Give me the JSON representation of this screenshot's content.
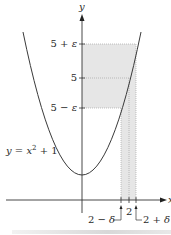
{
  "diagram": {
    "axes": {
      "x_label": "x",
      "y_label": "y"
    },
    "curve": {
      "label": "y = x² + 1",
      "label_parts": {
        "y": "y",
        "eq": " = ",
        "x": "x",
        "exp": "2",
        "rest": " + 1"
      }
    },
    "y_ticks": [
      {
        "label": "5 + ε",
        "parts": [
          "5 + ",
          "ε"
        ]
      },
      {
        "label": "5",
        "parts": [
          "5",
          ""
        ]
      },
      {
        "label": "5 − ε",
        "parts": [
          "5 − ",
          "ε"
        ]
      }
    ],
    "x_ticks": [
      {
        "label": "2 − δ",
        "parts": [
          "2 − ",
          "δ"
        ]
      },
      {
        "label": "2",
        "parts": [
          "2",
          ""
        ]
      },
      {
        "label": "2 + δ",
        "parts": [
          "2 + ",
          "δ"
        ]
      }
    ],
    "colors": {
      "shade": "#e6e6e6",
      "curve": "#3a3a3a",
      "axis": "#333333",
      "dotted": "#999999"
    }
  }
}
